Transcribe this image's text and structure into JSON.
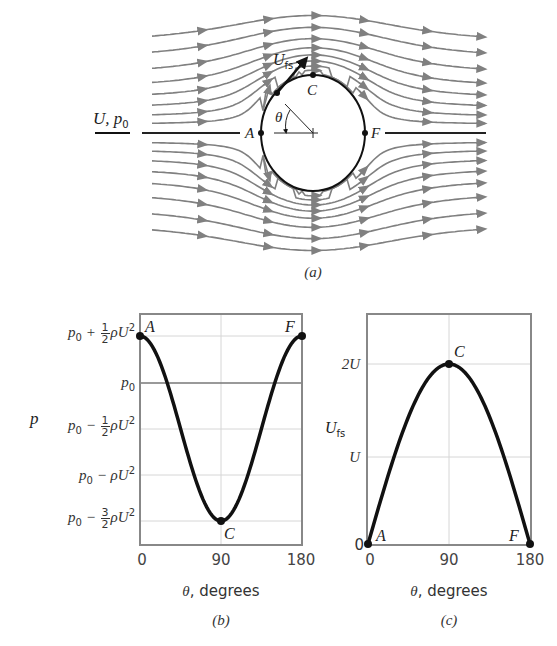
{
  "figure": {
    "panel_a": {
      "caption": "(a)",
      "freestream_label_U": "U",
      "freestream_label_sep": ", ",
      "freestream_label_p": "p",
      "freestream_label_sub": "0",
      "velocity_label": "U",
      "velocity_label_sub": "fs",
      "angle_label": "θ",
      "points": {
        "A": "A",
        "C": "C",
        "F": "F"
      },
      "streamline_color": "#808080",
      "body_color": "#111111"
    },
    "panel_b": {
      "caption": "(b)",
      "ylabel": "p",
      "xlabel_symbol": "θ",
      "xlabel_text": ", degrees",
      "xticks": [
        "0",
        "90",
        "180"
      ],
      "yticks": [
        {
          "base": "p",
          "sub": "0",
          "op": " + ",
          "num": "1",
          "den": "2",
          "tail": "ρU",
          "sup": "2"
        },
        {
          "base": "p",
          "sub": "0",
          "op": "",
          "num": "",
          "den": "",
          "tail": "",
          "sup": ""
        },
        {
          "base": "p",
          "sub": "0",
          "op": " − ",
          "num": "1",
          "den": "2",
          "tail": "ρU",
          "sup": "2"
        },
        {
          "base": "p",
          "sub": "0",
          "op": " − ",
          "num": "",
          "den": "",
          "tail": "ρU",
          "sup": "2"
        },
        {
          "base": "p",
          "sub": "0",
          "op": " − ",
          "num": "3",
          "den": "2",
          "tail": "ρU",
          "sup": "2"
        }
      ],
      "points": {
        "A": "A",
        "C": "C",
        "F": "F"
      }
    },
    "panel_c": {
      "caption": "(c)",
      "ylabel": "U",
      "ylabel_sub": "fs",
      "xlabel_symbol": "θ",
      "xlabel_text": ", degrees",
      "xticks": [
        "0",
        "90",
        "180"
      ],
      "yticks": [
        "2U",
        "U",
        "0"
      ],
      "points": {
        "A": "A",
        "C": "C",
        "F": "F"
      }
    }
  },
  "chart_data": [
    {
      "type": "line",
      "title": "(b) Surface pressure on a circular cylinder (inviscid flow)",
      "xlabel": "θ, degrees",
      "ylabel": "p",
      "x": [
        0,
        15,
        30,
        45,
        60,
        75,
        90,
        105,
        120,
        135,
        150,
        165,
        180
      ],
      "series": [
        {
          "name": "(p - p0)/(½ρU²) = 1 - 4sin²θ",
          "values": [
            1.0,
            0.732,
            0.0,
            -1.0,
            -2.0,
            -2.732,
            -3.0,
            -2.732,
            -2.0,
            -1.0,
            0.0,
            0.732,
            1.0
          ]
        }
      ],
      "ytick_labels": [
        "p0 + ½ρU²",
        "p0",
        "p0 − ½ρU²",
        "p0 − ρU²",
        "p0 − 3/2ρU²"
      ],
      "ytick_values_in_half_rhoU2": [
        1,
        0,
        -1,
        -2,
        -3
      ],
      "xlim": [
        0,
        180
      ],
      "annotations": [
        {
          "label": "A",
          "x": 0,
          "y": 1
        },
        {
          "label": "C",
          "x": 90,
          "y": -3
        },
        {
          "label": "F",
          "x": 180,
          "y": 1
        }
      ],
      "grid": true
    },
    {
      "type": "line",
      "title": "(c) Surface velocity on a circular cylinder",
      "xlabel": "θ, degrees",
      "ylabel": "U_fs",
      "x": [
        0,
        15,
        30,
        45,
        60,
        75,
        90,
        105,
        120,
        135,
        150,
        165,
        180
      ],
      "series": [
        {
          "name": "U_fs/U = 2 sinθ",
          "values": [
            0.0,
            0.518,
            1.0,
            1.414,
            1.732,
            1.932,
            2.0,
            1.932,
            1.732,
            1.414,
            1.0,
            0.518,
            0.0
          ]
        }
      ],
      "ytick_labels": [
        "0",
        "U",
        "2U"
      ],
      "ytick_values_in_U": [
        0,
        1,
        2
      ],
      "xlim": [
        0,
        180
      ],
      "ylim_in_U": [
        0,
        2.8
      ],
      "annotations": [
        {
          "label": "A",
          "x": 0,
          "y": 0
        },
        {
          "label": "C",
          "x": 90,
          "y": 2
        },
        {
          "label": "F",
          "x": 180,
          "y": 0
        }
      ],
      "grid": true
    }
  ]
}
